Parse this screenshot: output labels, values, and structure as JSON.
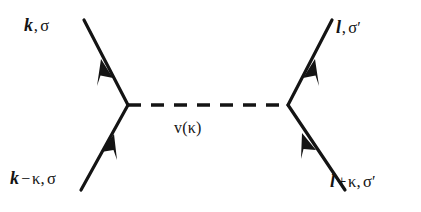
{
  "figure": {
    "type": "feynman-diagram",
    "background_color": "#ffffff",
    "line_color": "#141414"
  },
  "labels": {
    "incoming_upper_left": {
      "momentum": "k",
      "operator": "",
      "exchange": "",
      "comma": ",",
      "spin": "σ",
      "prime": ""
    },
    "outgoing_upper_right": {
      "momentum": "l",
      "operator": "",
      "exchange": "",
      "comma": ",",
      "spin": "σ",
      "prime": "′"
    },
    "incoming_lower_left": {
      "momentum": "k",
      "operator": "−",
      "exchange": "κ",
      "comma": ",",
      "spin": "σ",
      "prime": ""
    },
    "outgoing_lower_right": {
      "momentum": "l",
      "operator": "+",
      "exchange": "κ",
      "comma": ",",
      "spin": "σ",
      "prime": "′"
    },
    "interaction": {
      "text": "v(κ)"
    }
  },
  "geometry": {
    "left_vertex": {
      "x": 128,
      "y": 105
    },
    "right_vertex": {
      "x": 288,
      "y": 105
    },
    "interaction_line_style": "dashed",
    "legs": [
      {
        "name": "upper-left",
        "from": {
          "x": 128,
          "y": 105
        },
        "to": {
          "x": 84,
          "y": 20
        },
        "arrow": "outgoing"
      },
      {
        "name": "lower-left",
        "from": {
          "x": 81,
          "y": 190
        },
        "to": {
          "x": 128,
          "y": 105
        },
        "arrow": "incoming"
      },
      {
        "name": "upper-right",
        "from": {
          "x": 288,
          "y": 105
        },
        "to": {
          "x": 332,
          "y": 20
        },
        "arrow": "outgoing"
      },
      {
        "name": "lower-right",
        "from": {
          "x": 345,
          "y": 190
        },
        "to": {
          "x": 288,
          "y": 105
        },
        "arrow": "incoming"
      }
    ]
  }
}
